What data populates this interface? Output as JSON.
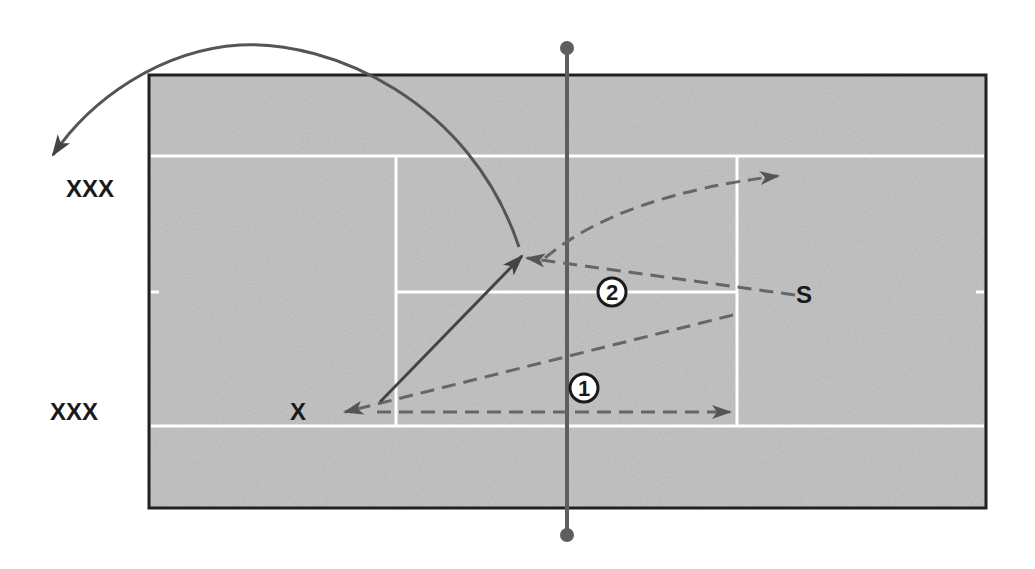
{
  "diagram": {
    "type": "tennis-court-drill",
    "colors": {
      "court": "#c9c9c9",
      "border": "#222222",
      "lines": "#ffffff",
      "net": "#5e5e5e",
      "paths": "#555555",
      "text": "#1a1a1a"
    },
    "labels": {
      "side_top": "XXX",
      "side_bottom": "XXX",
      "player_x": "X",
      "player_s": "S",
      "step_1": "1",
      "step_2": "2"
    }
  }
}
